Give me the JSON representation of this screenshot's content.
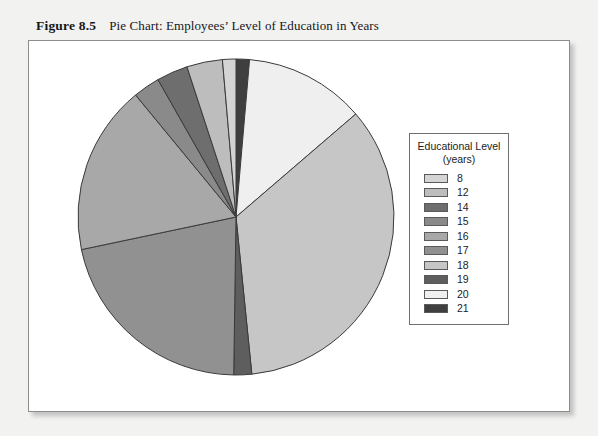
{
  "caption": {
    "figure_label": "Figure 8.5",
    "figure_title": "Pie Chart: Employees’ Level of Education in Years"
  },
  "legend": {
    "title_line1": "Educational Level",
    "title_line2": "(years)",
    "items": [
      {
        "label": "8",
        "color": "#d4d4d4"
      },
      {
        "label": "12",
        "color": "#bdbdbd"
      },
      {
        "label": "14",
        "color": "#6e6e6e"
      },
      {
        "label": "15",
        "color": "#8a8a8a"
      },
      {
        "label": "16",
        "color": "#a8a8a8"
      },
      {
        "label": "17",
        "color": "#919191"
      },
      {
        "label": "18",
        "color": "#c6c6c6"
      },
      {
        "label": "19",
        "color": "#5e5e5e"
      },
      {
        "label": "20",
        "color": "#efefef"
      },
      {
        "label": "21",
        "color": "#3f3f3f"
      }
    ]
  },
  "chart_data": {
    "type": "pie",
    "title": "Pie Chart: Employees’ Level of Education in Years",
    "legend_title": "Educational Level (years)",
    "legend_position": "right",
    "start_angle_deg": 0,
    "direction": "clockwise",
    "categories": [
      "8",
      "12",
      "14",
      "15",
      "16",
      "17",
      "18",
      "19",
      "20",
      "21"
    ],
    "values": [
      1.5,
      4.0,
      3.5,
      3.0,
      19.0,
      23.5,
      38.0,
      2.0,
      13.5,
      1.5
    ],
    "unit": "percent",
    "colors": [
      "#d4d4d4",
      "#bdbdbd",
      "#6e6e6e",
      "#8a8a8a",
      "#a8a8a8",
      "#919191",
      "#c6c6c6",
      "#5e5e5e",
      "#efefef",
      "#3f3f3f"
    ],
    "slice_order_clockwise_from_top": [
      "21",
      "20",
      "18",
      "19",
      "17",
      "16",
      "15",
      "14",
      "12",
      "8"
    ],
    "xlabel": "",
    "ylabel": ""
  },
  "pie_geometry": {
    "cx": 207,
    "cy": 176,
    "r": 158,
    "stroke": "#3a3a3a"
  }
}
